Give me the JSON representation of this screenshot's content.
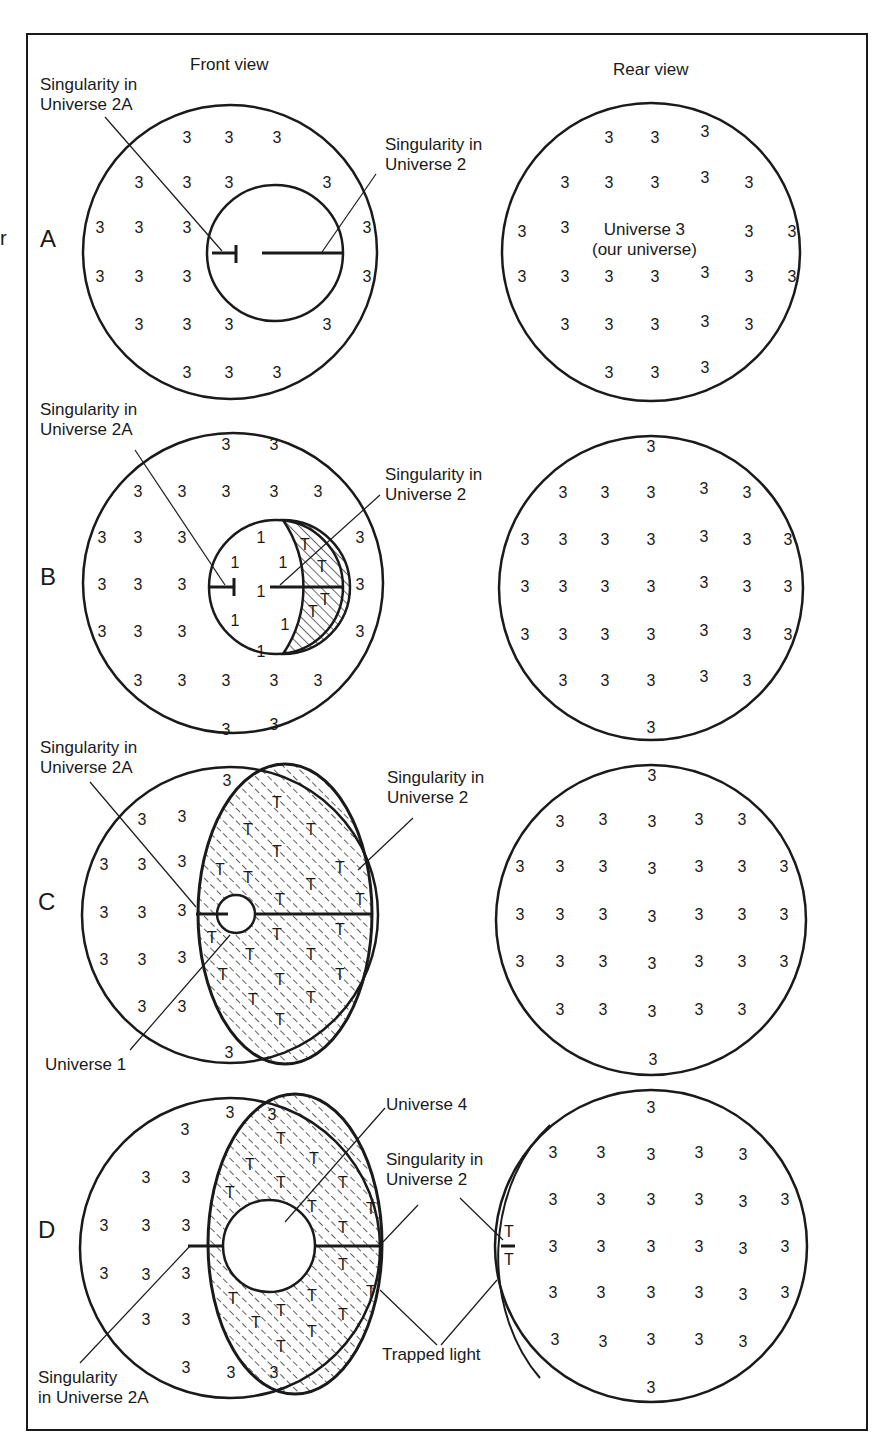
{
  "figure": {
    "clipped_margin_text": "r",
    "view_titles": {
      "front": "Front view",
      "rear": "Rear view"
    },
    "stroke_color": "#1a1a1a",
    "background": "#ffffff"
  },
  "panels": [
    {
      "letter": "A",
      "labels": {
        "sing2A": "Singularity in\nUniverse 2A",
        "sing2": "Singularity in\nUniverse 2"
      },
      "rear_caption": "Universe 3\n(our universe)"
    },
    {
      "letter": "B",
      "labels": {
        "sing2A": "Singularity in\nUniverse 2A",
        "sing2": "Singularity in\nUniverse 2"
      }
    },
    {
      "letter": "C",
      "labels": {
        "sing2A": "Singularity in\nUniverse 2A",
        "sing2": "Singularity in\nUniverse 2",
        "universe1": "Universe 1"
      }
    },
    {
      "letter": "D",
      "labels": {
        "universe4": "Universe 4",
        "sing2": "Singularity in\nUniverse 2",
        "trapped": "Trapped light",
        "sing2A": "Singularity\nin Universe 2A"
      }
    }
  ],
  "glyphs": {
    "u3": "3",
    "u1": "1",
    "u4": "4",
    "trapped": "T"
  }
}
